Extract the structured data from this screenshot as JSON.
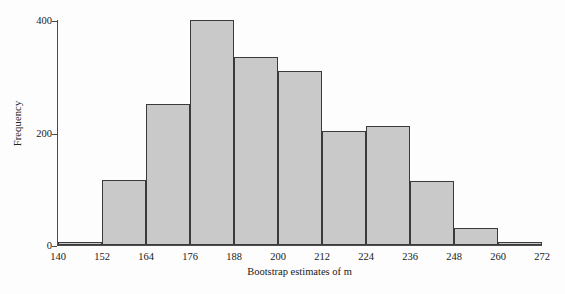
{
  "chart_data": {
    "type": "bar",
    "title": "",
    "subtitle": "",
    "xlabel": "Bootstrap estimates of m",
    "ylabel": "Frequency",
    "xlim": [
      140,
      272
    ],
    "ylim": [
      0,
      400
    ],
    "grid": false,
    "legend": null,
    "bin_width": 12,
    "bin_edges": [
      140,
      152,
      164,
      176,
      188,
      200,
      212,
      224,
      236,
      248,
      260,
      272
    ],
    "xtick_labels": [
      "140",
      "152",
      "164",
      "176",
      "188",
      "200",
      "212",
      "224",
      "236",
      "248",
      "260",
      "272"
    ],
    "ytick_labels": [
      "0",
      "200",
      "400"
    ],
    "ytick_values": [
      0,
      200,
      400
    ],
    "categories": [
      "140-152",
      "152-164",
      "164-176",
      "176-188",
      "188-200",
      "200-212",
      "212-224",
      "224-236",
      "236-248",
      "248-260",
      "260-272"
    ],
    "values": [
      6,
      115,
      250,
      400,
      335,
      310,
      203,
      212,
      114,
      30,
      5
    ],
    "bars": [
      {
        "bin_start": 140,
        "bin_end": 152,
        "frequency": 6
      },
      {
        "bin_start": 152,
        "bin_end": 164,
        "frequency": 115
      },
      {
        "bin_start": 164,
        "bin_end": 176,
        "frequency": 250
      },
      {
        "bin_start": 176,
        "bin_end": 188,
        "frequency": 400
      },
      {
        "bin_start": 188,
        "bin_end": 200,
        "frequency": 335
      },
      {
        "bin_start": 200,
        "bin_end": 212,
        "frequency": 310
      },
      {
        "bin_start": 212,
        "bin_end": 224,
        "frequency": 203
      },
      {
        "bin_start": 224,
        "bin_end": 236,
        "frequency": 212
      },
      {
        "bin_start": 236,
        "bin_end": 248,
        "frequency": 114
      },
      {
        "bin_start": 248,
        "bin_end": 260,
        "frequency": 30
      },
      {
        "bin_start": 260,
        "bin_end": 272,
        "frequency": 5
      }
    ],
    "colors": {
      "bar_fill": "#c9c9c9",
      "bar_edge": "#3a3a3a",
      "axis": "#4c4c4c",
      "text": "#202020",
      "background": "#fdfdfd"
    }
  }
}
